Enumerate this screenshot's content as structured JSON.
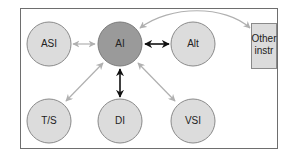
{
  "diagram": {
    "colors": {
      "frame": "#6e6e6e",
      "node_fill": "#dcdcdc",
      "node_stroke": "#8a8a8a",
      "center_fill": "#9a9a9a",
      "primary_arrow": "#111111",
      "secondary_arrow": "#b0b0b0"
    },
    "nodes": [
      {
        "id": "ai",
        "label": "AI"
      },
      {
        "id": "asi",
        "label": "ASI"
      },
      {
        "id": "alt",
        "label": "Alt"
      },
      {
        "id": "ts",
        "label": "T/S"
      },
      {
        "id": "di",
        "label": "DI"
      },
      {
        "id": "vsi",
        "label": "VSI"
      },
      {
        "id": "other",
        "label_line1": "Other",
        "label_line2": "instr"
      }
    ],
    "edges": [
      {
        "from": "ai",
        "to": "asi",
        "style": "secondary"
      },
      {
        "from": "ai",
        "to": "alt",
        "style": "primary"
      },
      {
        "from": "ai",
        "to": "di",
        "style": "primary"
      },
      {
        "from": "ai",
        "to": "ts",
        "style": "secondary"
      },
      {
        "from": "ai",
        "to": "vsi",
        "style": "secondary"
      },
      {
        "from": "ai",
        "to": "other",
        "style": "secondary"
      }
    ]
  }
}
